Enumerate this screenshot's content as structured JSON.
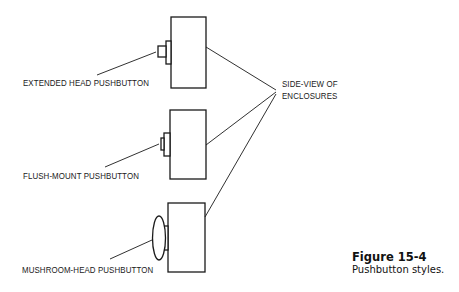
{
  "figure": {
    "number_label": "Figure 15-4",
    "caption": "Pushbutton styles."
  },
  "labels": {
    "extended": "EXTENDED HEAD PUSHBUTTON",
    "flush": "FLUSH-MOUNT PUSHBUTTON",
    "mushroom": "MUSHROOM-HEAD PUSHBUTTON",
    "enclosure_line1": "SIDE-VIEW OF",
    "enclosure_line2": "ENCLOSURES"
  },
  "colors": {
    "line": "#1a1a1a",
    "background": "#ffffff"
  }
}
